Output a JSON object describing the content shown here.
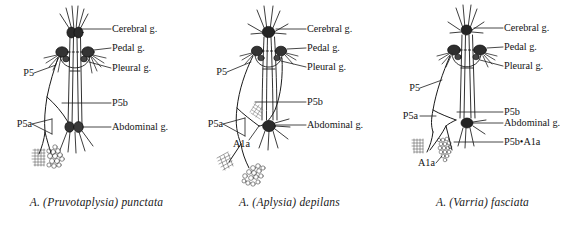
{
  "figure": {
    "type": "anatomical-line-diagram",
    "background_color": "#ffffff",
    "ink_color": "#1a1a1a",
    "panel_count": 3
  },
  "panels": [
    {
      "id": "panel-left",
      "caption_prefix": "A. (",
      "caption_subgenus": "Pruvotaplysia",
      "caption_suffix": ") punctata",
      "caption_full": "A. (Pruvotaplysia) punctata",
      "labels": {
        "cerebral": "Cerebral g.",
        "pedal": "Pedal g.",
        "pleural": "Pleural g.",
        "abdominal": "Abdominal g.",
        "p5": "P5",
        "p5a": "P5a",
        "p5b": "P5b"
      },
      "features": {
        "hatched_patch": "hatched-square",
        "circle_cluster": "circle-cluster",
        "a1a_present": false,
        "p5b_a1a_present": false
      }
    },
    {
      "id": "panel-middle",
      "caption_prefix": "A. (",
      "caption_subgenus": "Aplysia",
      "caption_suffix": ") depilans",
      "caption_full": "A. (Aplysia) depilans",
      "labels": {
        "cerebral": "Cerebral g.",
        "pedal": "Pedal g.",
        "pleural": "Pleural g.",
        "abdominal": "Abdominal g.",
        "p5": "P5",
        "p5a": "P5a",
        "p5b": "P5b",
        "a1a": "A1a"
      },
      "features": {
        "hatched_patch": "hatched-square",
        "circle_cluster": "circle-cluster",
        "a1a_present": true,
        "p5b_a1a_present": false
      }
    },
    {
      "id": "panel-right",
      "caption_prefix": "A. (",
      "caption_subgenus": "Varria",
      "caption_suffix": ") fasciata",
      "caption_full": "A. (Varria) fasciata",
      "labels": {
        "cerebral": "Cerebral g.",
        "pedal": "Pedal g.",
        "pleural": "Pleural g.",
        "abdominal": "Abdominal g.",
        "p5": "P5",
        "p5a": "P5a",
        "p5b": "P5b",
        "a1a": "A1a",
        "p5b_a1a": "P5b•A1a"
      },
      "features": {
        "hatched_patch": "hatched-square",
        "circle_cluster": "circle-cluster",
        "a1a_present": true,
        "p5b_a1a_present": true
      }
    }
  ]
}
